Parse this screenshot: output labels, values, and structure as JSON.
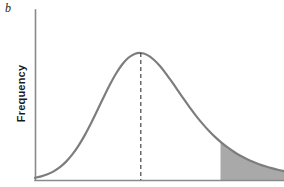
{
  "figure": {
    "panel_label": "b",
    "y_axis_label": "Frequency",
    "background_color": "#ffffff"
  },
  "style": {
    "axis_color": "#8a8a8a",
    "curve_color": "#7d7d7d",
    "fill_color": "#a9a9a9",
    "dashed_line_color": "#333333",
    "curve_width": 2.2,
    "axis_width": 1.6,
    "dash_pattern": "4,3"
  },
  "chart_data": {
    "type": "line",
    "title": "",
    "subtitle": "",
    "xlabel": "",
    "ylabel": "Frequency",
    "grid": false,
    "legend": null,
    "axis_ranges": {
      "x": [
        0,
        10
      ],
      "y": [
        0,
        1
      ]
    },
    "x_ticks": [],
    "y_ticks": [],
    "series": [
      {
        "name": "frequency distribution",
        "type": "line",
        "x": [
          0.0,
          0.25,
          0.5,
          0.75,
          1.0,
          1.25,
          1.5,
          1.75,
          2.0,
          2.25,
          2.5,
          2.75,
          3.0,
          3.25,
          3.5,
          3.75,
          4.0,
          4.25,
          4.5,
          4.75,
          5.0,
          5.25,
          5.5,
          5.75,
          6.0,
          6.25,
          6.5,
          6.75,
          7.0,
          7.25,
          7.5,
          7.75,
          8.0,
          8.25,
          8.5,
          8.75,
          9.0,
          9.25,
          9.5,
          9.75,
          10.0
        ],
        "y": [
          0.0111,
          0.018,
          0.0283,
          0.0432,
          0.0639,
          0.0916,
          0.1274,
          0.1715,
          0.2237,
          0.2827,
          0.3463,
          0.4111,
          0.4735,
          0.5296,
          0.5757,
          0.6093,
          0.6285,
          0.6331,
          0.6237,
          0.602,
          0.5705,
          0.5319,
          0.4889,
          0.444,
          0.3991,
          0.3557,
          0.3148,
          0.2772,
          0.243,
          0.2124,
          0.1851,
          0.161,
          0.1398,
          0.1212,
          0.1051,
          0.091,
          0.0788,
          0.0682,
          0.059,
          0.051,
          0.0441
        ]
      }
    ],
    "annotations": [
      {
        "name": "mean-line",
        "type": "vline",
        "x": 4.25,
        "label": "",
        "style": "dashed",
        "from_y": 0,
        "to_y": 0.6331
      },
      {
        "name": "critical-region",
        "type": "shaded-area",
        "x_start": 7.45,
        "x_end": 10.0,
        "label": "",
        "fill": "#a9a9a9"
      }
    ]
  }
}
